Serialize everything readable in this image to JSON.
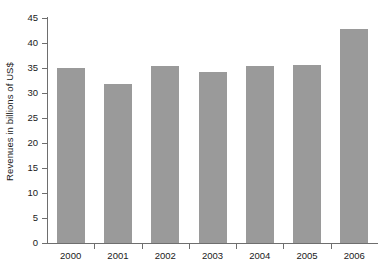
{
  "chart_data": {
    "type": "bar",
    "title": "",
    "subtitle": "",
    "xlabel": "",
    "ylabel": "Revenues in billions of US$",
    "categories": [
      "2000",
      "2001",
      "2002",
      "2003",
      "2004",
      "2005",
      "2006"
    ],
    "values": [
      35.0,
      31.8,
      35.4,
      34.3,
      35.5,
      35.7,
      42.9
    ],
    "series": [
      {
        "name": "Revenues",
        "values": [
          35.0,
          31.8,
          35.4,
          34.3,
          35.5,
          35.7,
          42.9
        ]
      }
    ],
    "ylim": [
      0,
      45
    ],
    "ytick_values": [
      0,
      5,
      10,
      15,
      20,
      25,
      30,
      35,
      40,
      45
    ],
    "ytick_labels": [
      "0",
      "5",
      "10",
      "15",
      "20",
      "25",
      "30",
      "35",
      "40",
      "45"
    ],
    "xtick_labels": [
      "2000",
      "2001",
      "2002",
      "2003",
      "2004",
      "2005",
      "2006"
    ],
    "grid": false,
    "legend": false,
    "legend_position": "none",
    "annotations": [],
    "bar_color": "#9a9a9a",
    "axis_color": "#6e6e6e",
    "background_color": "#ffffff",
    "text_color": "#1a1a1a"
  },
  "caption": {
    "remnant_text": ""
  }
}
